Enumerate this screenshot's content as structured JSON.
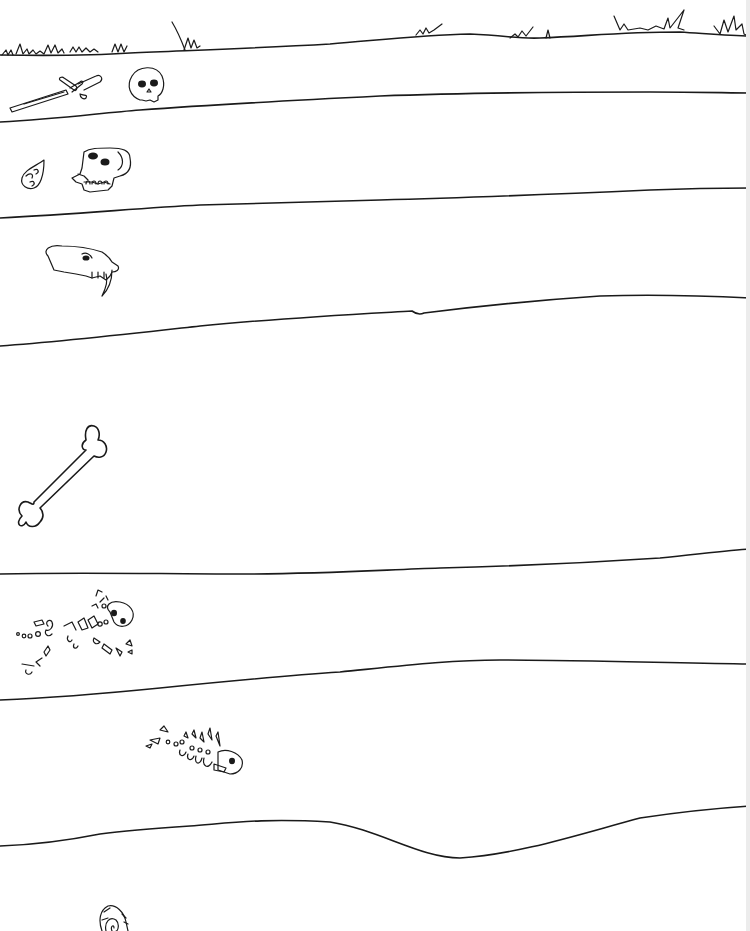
{
  "title": "Rock layers with fossils",
  "colors": {
    "ink": "#1a1a1a",
    "paper": "#ffffff"
  },
  "layers": [
    {
      "index": 1,
      "name": "surface-soil",
      "fossils": [
        "sword",
        "human-skull"
      ]
    },
    {
      "index": 2,
      "name": "layer-2",
      "fossils": [
        "arrowhead",
        "ape-skull"
      ]
    },
    {
      "index": 3,
      "name": "layer-3",
      "fossils": [
        "sabertooth-skull"
      ]
    },
    {
      "index": 4,
      "name": "layer-4",
      "fossils": [
        "large-bone"
      ]
    },
    {
      "index": 5,
      "name": "layer-5",
      "fossils": [
        "reptile-skeleton"
      ]
    },
    {
      "index": 6,
      "name": "layer-6",
      "fossils": [
        "fish-skeleton"
      ]
    },
    {
      "index": 7,
      "name": "layer-7",
      "fossils": [
        "ammonite-shell"
      ]
    }
  ],
  "surface": {
    "feature": "grass-tufts"
  }
}
